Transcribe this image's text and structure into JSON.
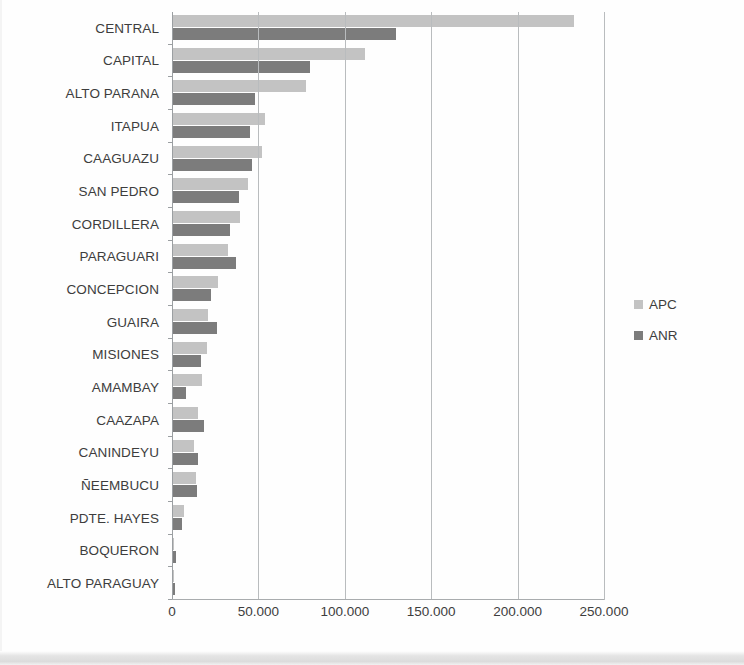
{
  "chart_data": {
    "type": "bar",
    "orientation": "horizontal",
    "title": "",
    "subtitle": "",
    "xlabel": "",
    "ylabel": "",
    "xlim": [
      0,
      250000
    ],
    "xticks": [
      0,
      50000,
      100000,
      150000,
      200000,
      250000
    ],
    "xtick_labels": [
      "0",
      "50.000",
      "100.000",
      "150.000",
      "200.000",
      "250.000"
    ],
    "grid": "vertical",
    "legend_position": "right",
    "categories": [
      "CENTRAL",
      "CAPITAL",
      "ALTO PARANA",
      "ITAPUA",
      "CAAGUAZU",
      "SAN PEDRO",
      "CORDILLERA",
      "PARAGUARI",
      "CONCEPCION",
      "GUAIRA",
      "MISIONES",
      "AMAMBAY",
      "CAAZAPA",
      "CANINDEYU",
      "ÑEEMBUCU",
      "PDTE. HAYES",
      "BOQUERON",
      "ALTO PARAGUAY"
    ],
    "series": [
      {
        "name": "APC",
        "color": "#c3c3c3",
        "values": [
          232900,
          111800,
          77600,
          53900,
          52100,
          44000,
          39400,
          32400,
          26900,
          21100,
          20400,
          17200,
          15300,
          12700,
          13700,
          7000,
          1400,
          700
        ]
      },
      {
        "name": "ANR",
        "color": "#7c7c7c",
        "values": [
          129800,
          79900,
          48000,
          45200,
          46400,
          38800,
          33600,
          37000,
          22600,
          26300,
          16900,
          8000,
          18800,
          15100,
          14300,
          5800,
          2500,
          1500
        ]
      }
    ]
  },
  "legend": {
    "items": [
      {
        "label": "APC",
        "color": "#c3c3c3"
      },
      {
        "label": "ANR",
        "color": "#7c7c7c"
      }
    ]
  }
}
